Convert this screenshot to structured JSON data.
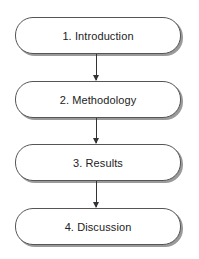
{
  "diagram": {
    "type": "flowchart",
    "direction": "top-to-bottom",
    "nodes": [
      {
        "id": "n1",
        "label": "1. Introduction"
      },
      {
        "id": "n2",
        "label": "2. Methodology"
      },
      {
        "id": "n3",
        "label": "3. Results"
      },
      {
        "id": "n4",
        "label": "4. Discussion"
      }
    ],
    "edges": [
      {
        "from": "n1",
        "to": "n2"
      },
      {
        "from": "n2",
        "to": "n3"
      },
      {
        "from": "n3",
        "to": "n4"
      }
    ],
    "colors": {
      "node_border": "#555555",
      "node_shadow": "#9a9a9a",
      "arrow": "#333333",
      "text": "#222222",
      "background": "#ffffff"
    }
  }
}
